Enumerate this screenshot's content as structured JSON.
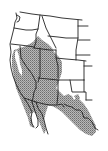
{
  "map": {
    "title": "Western United States range map",
    "region": "Western United States and northern Mexico",
    "legend": {
      "shaded_meaning": "range",
      "fill_color": "#a6a6a6",
      "stipple_color": "#7a7a7a",
      "outline_color": "#222222",
      "background": "#ffffff"
    },
    "states_outlined": [
      "Washington",
      "Oregon",
      "California",
      "Idaho",
      "Nevada",
      "Montana",
      "Wyoming",
      "Utah",
      "Arizona",
      "Colorado",
      "New Mexico",
      "Texas"
    ],
    "range_covers": [
      "California (interior & south)",
      "Nevada",
      "Utah",
      "Arizona",
      "southern Idaho",
      "western Colorado",
      "New Mexico (southwest)",
      "western Texas",
      "Baja California",
      "northern Mexico"
    ]
  }
}
